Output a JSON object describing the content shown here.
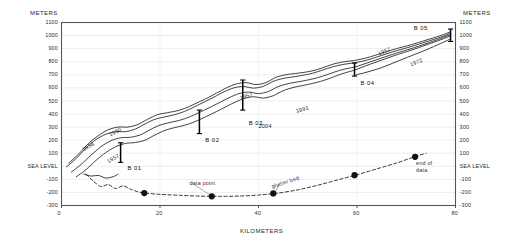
{
  "figure": {
    "axis_titles": {
      "y_left": "METERS",
      "y_right": "METERS",
      "x": "KILOMETERS"
    },
    "sea_level_text": "SEA LEVEL"
  },
  "chart_data": {
    "type": "line",
    "title": "",
    "xlabel": "KILOMETERS",
    "ylabel": "METERS",
    "xlim": [
      0,
      80
    ],
    "ylim": [
      -300,
      1100
    ],
    "grid": true,
    "x_ticks": [
      0,
      20,
      40,
      60,
      80
    ],
    "x_tick_labels": [
      "0",
      "20",
      "40",
      "60",
      "80"
    ],
    "y_ticks": [
      -300,
      -200,
      -100,
      0,
      100,
      200,
      300,
      400,
      500,
      600,
      700,
      800,
      900,
      1000,
      1100
    ],
    "y_tick_labels": [
      "-300",
      "-200",
      "-100",
      "SEA LEVEL",
      "100",
      "200",
      "300",
      "400",
      "500",
      "600",
      "700",
      "800",
      "900",
      "1000",
      "1100"
    ],
    "legend_position": "none",
    "annotations": [
      {
        "name": "year-1950",
        "text": "1950",
        "x_km": 9.5,
        "y_m": 265,
        "rotation": -27
      },
      {
        "name": "year-1958",
        "text": "1958",
        "x_km": 4.0,
        "y_m": 150,
        "rotation": -30
      },
      {
        "name": "year-1957-left",
        "text": "1957",
        "x_km": 9.0,
        "y_m": 55,
        "rotation": -30
      },
      {
        "name": "year-1957-mid",
        "text": "1957",
        "x_km": 36.0,
        "y_m": 545,
        "rotation": -18
      },
      {
        "name": "year-1991",
        "text": "1991",
        "x_km": 47.5,
        "y_m": 445,
        "rotation": -16
      },
      {
        "name": "year-2004",
        "text": "2004",
        "x_km": 40.0,
        "y_m": 330,
        "rotation": 0
      },
      {
        "name": "year-1957-right",
        "text": "1957",
        "x_km": 64.0,
        "y_m": 880,
        "rotation": -23
      },
      {
        "name": "year-1972-right",
        "text": "1972",
        "x_km": 70.5,
        "y_m": 800,
        "rotation": -23
      },
      {
        "name": "note-data-point",
        "text": "data point",
        "x_km": 26.0,
        "y_m": -105,
        "rotation": 0
      },
      {
        "name": "note-glacier-bed",
        "text": "glacier bed",
        "x_km": 42.5,
        "y_m": -95,
        "rotation": -18
      },
      {
        "name": "note-end-of-data-line1",
        "text": "end of",
        "x_km": 72.0,
        "y_m": 45,
        "rotation": 0
      },
      {
        "name": "note-end-of-data-line2",
        "text": "data",
        "x_km": 72.0,
        "y_m": -5,
        "rotation": 0
      }
    ],
    "borehole_markers": [
      {
        "name": "B 01",
        "label": "B 01",
        "x_km": 12.0,
        "y_top_m": 180,
        "y_bottom_m": 30,
        "label_x_km": 13.4,
        "label_y_m": -20
      },
      {
        "name": "B 02",
        "label": "B 02",
        "x_km": 28.0,
        "y_top_m": 430,
        "y_bottom_m": 250,
        "label_x_km": 29.2,
        "label_y_m": 195
      },
      {
        "name": "B 03",
        "label": "B 03",
        "x_km": 36.8,
        "y_top_m": 660,
        "y_bottom_m": 430,
        "label_x_km": 38.0,
        "label_y_m": 330
      },
      {
        "name": "B 04",
        "label": "B 04",
        "x_km": 59.5,
        "y_top_m": 790,
        "y_bottom_m": 690,
        "label_x_km": 60.7,
        "label_y_m": 630
      },
      {
        "name": "B 05",
        "label": "B 05",
        "x_km": 79.0,
        "y_top_m": 1050,
        "y_bottom_m": 955,
        "label_x_km": 71.5,
        "label_y_m": 1055
      }
    ],
    "series": [
      {
        "name": "surface-1950",
        "style": "solid",
        "points": [
          [
            1.5,
            25
          ],
          [
            3.5,
            95
          ],
          [
            5.5,
            175
          ],
          [
            7.5,
            235
          ],
          [
            9.5,
            280
          ],
          [
            11.5,
            300
          ],
          [
            13.5,
            300
          ],
          [
            15.5,
            320
          ],
          [
            17.5,
            360
          ],
          [
            19.5,
            395
          ],
          [
            21.5,
            410
          ],
          [
            23.5,
            425
          ],
          [
            25.5,
            450
          ],
          [
            27.5,
            485
          ],
          [
            29.5,
            520
          ],
          [
            31.5,
            560
          ],
          [
            33.5,
            600
          ],
          [
            35.5,
            630
          ],
          [
            37.5,
            640
          ],
          [
            39.5,
            625
          ],
          [
            41.5,
            640
          ],
          [
            43.5,
            680
          ],
          [
            45.5,
            700
          ],
          [
            47.5,
            710
          ],
          [
            49.5,
            720
          ],
          [
            51.5,
            735
          ],
          [
            53.5,
            760
          ],
          [
            55.5,
            785
          ],
          [
            57.5,
            800
          ],
          [
            59.5,
            810
          ],
          [
            62,
            830
          ],
          [
            65,
            865
          ],
          [
            68,
            900
          ],
          [
            71,
            930
          ],
          [
            74,
            965
          ],
          [
            77,
            1000
          ],
          [
            79,
            1030
          ]
        ]
      },
      {
        "name": "surface-1958",
        "style": "solid",
        "points": [
          [
            1.0,
            -5
          ],
          [
            3.0,
            60
          ],
          [
            5.0,
            140
          ],
          [
            7.0,
            205
          ],
          [
            9.0,
            245
          ],
          [
            11.0,
            265
          ],
          [
            13.0,
            265
          ],
          [
            15.0,
            285
          ],
          [
            17.0,
            325
          ],
          [
            19.0,
            360
          ],
          [
            21.0,
            378
          ],
          [
            23.0,
            395
          ],
          [
            25.0,
            420
          ],
          [
            27.0,
            455
          ],
          [
            29.0,
            492
          ],
          [
            31.0,
            530
          ],
          [
            33.0,
            570
          ],
          [
            35.0,
            600
          ],
          [
            37.0,
            610
          ],
          [
            39.0,
            598
          ],
          [
            41.0,
            612
          ],
          [
            43.0,
            650
          ],
          [
            45.0,
            672
          ],
          [
            47.0,
            684
          ],
          [
            49.0,
            696
          ],
          [
            51.0,
            712
          ],
          [
            53.0,
            736
          ],
          [
            55.0,
            760
          ],
          [
            57.0,
            778
          ],
          [
            59.5,
            792
          ],
          [
            62,
            812
          ],
          [
            65,
            848
          ],
          [
            68,
            884
          ],
          [
            71,
            916
          ],
          [
            74,
            952
          ],
          [
            77,
            988
          ],
          [
            79,
            1018
          ]
        ]
      },
      {
        "name": "surface-1991",
        "style": "solid",
        "points": [
          [
            2.0,
            -45
          ],
          [
            4.0,
            15
          ],
          [
            6.0,
            85
          ],
          [
            8.0,
            150
          ],
          [
            10.0,
            195
          ],
          [
            12.0,
            218
          ],
          [
            14.0,
            222
          ],
          [
            16.0,
            240
          ],
          [
            18.0,
            280
          ],
          [
            20.0,
            315
          ],
          [
            22.0,
            335
          ],
          [
            24.0,
            352
          ],
          [
            26.0,
            378
          ],
          [
            28.0,
            412
          ],
          [
            30.0,
            448
          ],
          [
            32.0,
            486
          ],
          [
            34.0,
            524
          ],
          [
            36.0,
            556
          ],
          [
            38.0,
            568
          ],
          [
            40.0,
            556
          ],
          [
            42.0,
            572
          ],
          [
            44.0,
            610
          ],
          [
            46.0,
            632
          ],
          [
            48.0,
            646
          ],
          [
            50.0,
            660
          ],
          [
            52.0,
            678
          ],
          [
            54.0,
            702
          ],
          [
            56.0,
            728
          ],
          [
            58.0,
            748
          ],
          [
            59.8,
            762
          ],
          [
            62,
            790
          ],
          [
            65,
            828
          ],
          [
            68,
            866
          ],
          [
            71,
            900
          ],
          [
            74,
            938
          ],
          [
            77,
            978
          ],
          [
            79,
            1008
          ]
        ]
      },
      {
        "name": "surface-2004",
        "style": "solid",
        "points": [
          [
            3.0,
            -80
          ],
          [
            5.0,
            -25
          ],
          [
            7.0,
            45
          ],
          [
            9.0,
            105
          ],
          [
            11.0,
            150
          ],
          [
            13.0,
            175
          ],
          [
            15.0,
            182
          ],
          [
            17.0,
            200
          ],
          [
            19.0,
            240
          ],
          [
            21.0,
            275
          ],
          [
            23.0,
            296
          ],
          [
            25.0,
            314
          ],
          [
            27.0,
            340
          ],
          [
            29.0,
            374
          ],
          [
            31.0,
            410
          ],
          [
            33.0,
            448
          ],
          [
            35.0,
            486
          ],
          [
            37.0,
            518
          ],
          [
            39.0,
            532
          ],
          [
            41.0,
            522
          ],
          [
            43.0,
            540
          ],
          [
            45.0,
            578
          ],
          [
            47.0,
            602
          ],
          [
            49.0,
            618
          ],
          [
            51.0,
            634
          ],
          [
            53.0,
            654
          ],
          [
            55.0,
            680
          ],
          [
            57.0,
            708
          ],
          [
            59.0,
            730
          ],
          [
            59.8,
            740
          ],
          [
            62,
            772
          ],
          [
            65,
            812
          ],
          [
            68,
            852
          ],
          [
            71,
            888
          ],
          [
            74,
            928
          ],
          [
            77,
            968
          ],
          [
            79,
            998
          ]
        ]
      },
      {
        "name": "surface-lower-branch",
        "style": "solid",
        "points": [
          [
            59.8,
            700
          ],
          [
            62,
            720
          ],
          [
            65,
            755
          ],
          [
            68,
            800
          ],
          [
            71,
            845
          ],
          [
            74,
            890
          ],
          [
            77,
            940
          ],
          [
            79,
            975
          ]
        ]
      },
      {
        "name": "terminus-tongue-1",
        "style": "solid",
        "points": [
          [
            4.5,
            -60
          ],
          [
            6.0,
            -75
          ],
          [
            7.5,
            -70
          ],
          [
            9.0,
            -90
          ],
          [
            10.5,
            -80
          ],
          [
            11.5,
            -60
          ]
        ]
      },
      {
        "name": "glacier-bed",
        "style": "dashed",
        "points": [
          [
            5.0,
            -60
          ],
          [
            6.5,
            -115
          ],
          [
            8.0,
            -155
          ],
          [
            9.5,
            -140
          ],
          [
            11.0,
            -170
          ],
          [
            12.5,
            -150
          ],
          [
            14.0,
            -175
          ],
          [
            15.5,
            -195
          ],
          [
            17.0,
            -205
          ],
          [
            20.0,
            -215
          ],
          [
            24.0,
            -222
          ],
          [
            28.0,
            -228
          ],
          [
            32.0,
            -230
          ],
          [
            36.0,
            -228
          ],
          [
            40.0,
            -220
          ],
          [
            44.0,
            -205
          ],
          [
            48.0,
            -180
          ],
          [
            52.0,
            -145
          ],
          [
            56.0,
            -105
          ],
          [
            60.0,
            -65
          ],
          [
            64.0,
            -20
          ],
          [
            68.0,
            25
          ],
          [
            71.5,
            70
          ],
          [
            74.0,
            100
          ]
        ]
      }
    ],
    "data_points": [
      {
        "x_km": 16.8,
        "y_m": -205
      },
      {
        "x_km": 30.5,
        "y_m": -230
      },
      {
        "x_km": 43.0,
        "y_m": -208
      },
      {
        "x_km": 59.5,
        "y_m": -68
      },
      {
        "x_km": 71.8,
        "y_m": 72
      }
    ]
  }
}
